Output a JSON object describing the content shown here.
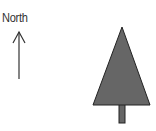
{
  "compass": {
    "label": "North",
    "arrow_direction": "up",
    "icon": "north-arrow-icon",
    "color": "#333333"
  },
  "tree": {
    "icon": "tree-icon",
    "canopy_fill": "#666666",
    "outline": "#222222",
    "trunk_fill": "#666666"
  }
}
